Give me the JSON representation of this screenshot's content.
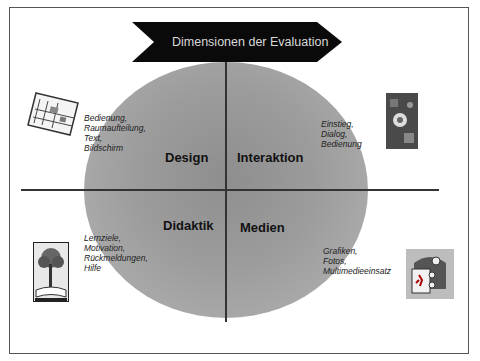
{
  "banner": {
    "title": "Dimensionen der Evaluation"
  },
  "quadrants": {
    "design": {
      "label": "Design",
      "notes": [
        "Bedienung,",
        "Raumaufteilung,",
        "Text,",
        "Bildschirm"
      ],
      "icon": "floorplan-icon"
    },
    "interaktion": {
      "label": "Interaktion",
      "notes": [
        "Einstieg,",
        "Dialog,",
        "Bedienung"
      ],
      "icon": "interactive-collage-icon"
    },
    "didaktik": {
      "label": "Didaktik",
      "notes": [
        "Lernziele,",
        "Motivation,",
        "Rückmeldungen,",
        "Hilfe"
      ],
      "icon": "tree-book-icon"
    },
    "medien": {
      "label": "Medien",
      "notes": [
        "Grafiken,",
        "Fotos,",
        "Multimedieeinsatz"
      ],
      "icon": "multimedia-icon"
    }
  },
  "colors": {
    "circle": "#9c9c9c",
    "banner": "#0a0a0a",
    "banner_text": "#d8d8d8",
    "frame": "#555555"
  }
}
